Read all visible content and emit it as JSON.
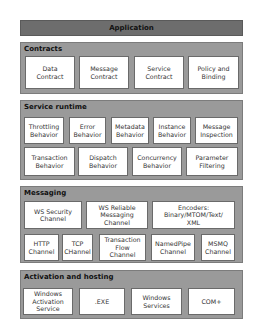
{
  "application": {
    "label": "Application"
  },
  "sections": {
    "contracts": {
      "title": "Contracts",
      "items": [
        "Data\nContract",
        "Message\nContract",
        "Service\nContract",
        "Policy and\nBinding"
      ]
    },
    "service_runtime": {
      "title": "Service runtime",
      "row1": [
        "Throttling\nBehavior",
        "Error\nBehavior",
        "Metadata\nBehavior",
        "Instance\nBehavior",
        "Message\nInspection"
      ],
      "row2": [
        "Transaction\nBehavior",
        "Dispatch\nBehavior",
        "Concurrency\nBehavior",
        "Parameter\nFiltering"
      ]
    },
    "messaging": {
      "title": "Messaging",
      "row1": [
        "WS Security\nChannel",
        "WS Reliable\nMessaging\nChannel",
        "Encoders:\nBinary/MTOM/Text/\nXML"
      ],
      "row2": [
        "HTTP\nChannel",
        "TCP\nCHannel",
        "Transaction\nFlow\nChannel",
        "NamedPipe\nChannel",
        "MSMQ\nChannel"
      ]
    },
    "activation_hosting": {
      "title": "Activation and hosting",
      "items": [
        "Windows\nActivation\nService",
        ".EXE",
        "Windows\nServices",
        "COM+"
      ]
    }
  },
  "colors": {
    "application_bar": "#6d6d6d",
    "section_background": "#9a9a9a",
    "box_background": "#ffffff"
  }
}
